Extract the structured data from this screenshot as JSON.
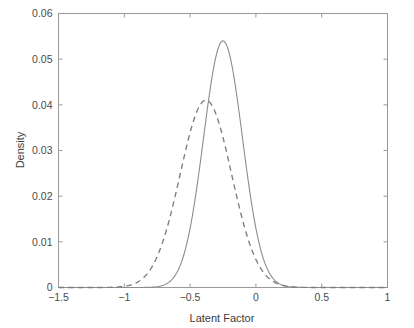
{
  "chart_data": {
    "type": "line",
    "title": "",
    "subtitle": "",
    "xlabel": "Latent Factor",
    "ylabel": "Density",
    "xlim": [
      -1.5,
      1
    ],
    "ylim": [
      0,
      0.06
    ],
    "grid": false,
    "legend": null,
    "xticks": [
      -1.5,
      -1,
      -0.5,
      0,
      0.5,
      1
    ],
    "xtick_labels": [
      "−1.5",
      "−1",
      "−0.5",
      "0",
      "0.5",
      "1"
    ],
    "yticks": [
      0,
      0.01,
      0.02,
      0.03,
      0.04,
      0.05,
      0.06
    ],
    "ytick_labels": [
      "0",
      "0.01",
      "0.02",
      "0.03",
      "0.04",
      "0.05",
      "0.06"
    ],
    "series": [
      {
        "name": "solid-density",
        "style": "solid",
        "color": "#8c8c8c",
        "peak_x": -0.25,
        "peak_y": 0.054,
        "sigma": 0.148,
        "amplitude": 0.054,
        "x": [
          -1.5,
          -1.4,
          -1.3,
          -1.2,
          -1.1,
          -1.0,
          -0.95,
          -0.9,
          -0.85,
          -0.8,
          -0.75,
          -0.7,
          -0.65,
          -0.6,
          -0.55,
          -0.5,
          -0.45,
          -0.4,
          -0.35,
          -0.3,
          -0.25,
          -0.2,
          -0.15,
          -0.1,
          -0.05,
          0.0,
          0.05,
          0.1,
          0.15,
          0.2,
          0.25,
          0.3,
          0.35,
          0.4,
          0.45,
          0.5,
          0.6,
          0.7,
          0.8,
          0.9,
          1.0
        ],
        "values": [
          0.0,
          0.0,
          0.0,
          0.0,
          0.0,
          0.0001,
          0.0002,
          0.0005,
          0.0011,
          0.0023,
          0.0045,
          0.0083,
          0.0143,
          0.0229,
          0.0339,
          0.0459,
          0.0528,
          0.0542,
          0.0528,
          0.0459,
          0.0339,
          0.0229,
          0.0143,
          0.0083,
          0.0045,
          0.0023,
          0.0011,
          0.0005,
          0.0002,
          0.0001,
          0.0,
          0.0,
          0.0,
          0.0,
          0.0,
          0.0,
          0.0,
          0.0,
          0.0,
          0.0,
          0.0
        ]
      },
      {
        "name": "dashed-density",
        "style": "dashed",
        "color": "#7d7d7d",
        "peak_x": -0.38,
        "peak_y": 0.041,
        "sigma": 0.195,
        "amplitude": 0.041,
        "x": [
          -1.5,
          -1.4,
          -1.3,
          -1.2,
          -1.1,
          -1.0,
          -0.95,
          -0.9,
          -0.85,
          -0.8,
          -0.75,
          -0.7,
          -0.65,
          -0.6,
          -0.55,
          -0.5,
          -0.45,
          -0.4,
          -0.35,
          -0.3,
          -0.25,
          -0.2,
          -0.15,
          -0.1,
          -0.05,
          0.0,
          0.05,
          0.1,
          0.15,
          0.2,
          0.25,
          0.3,
          0.35,
          0.4,
          0.45,
          0.5,
          0.6,
          0.7,
          0.8,
          0.9,
          1.0
        ],
        "values": [
          0.0,
          0.0,
          0.0,
          0.0001,
          0.0003,
          0.0013,
          0.0024,
          0.0041,
          0.0068,
          0.0107,
          0.0159,
          0.0223,
          0.0292,
          0.0353,
          0.0396,
          0.0412,
          0.0402,
          0.0369,
          0.0319,
          0.0261,
          0.0203,
          0.0149,
          0.0104,
          0.0069,
          0.0043,
          0.0026,
          0.0015,
          0.0008,
          0.0004,
          0.0002,
          0.0001,
          0.0,
          0.0,
          0.0,
          0.0,
          0.0,
          0.0,
          0.0,
          0.0,
          0.0,
          0.0
        ]
      }
    ]
  },
  "axes": {
    "x_title": "Latent Factor",
    "y_title": "Density"
  },
  "colors": {
    "axis": "#9a9a9a",
    "text": "#444444",
    "solid_curve": "#8c8c8c",
    "dashed_curve": "#7d7d7d",
    "background": "#ffffff"
  }
}
